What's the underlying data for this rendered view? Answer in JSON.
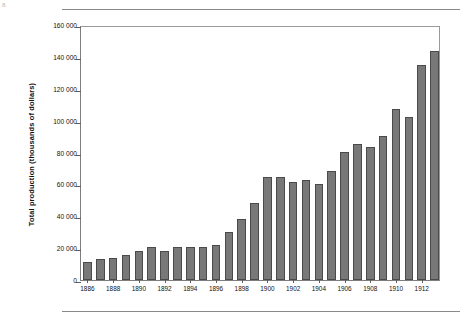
{
  "page": {
    "corner_mark": "8",
    "top_rule": true,
    "bottom_rule": true
  },
  "chart_data": {
    "type": "bar",
    "title": "",
    "xlabel": "",
    "ylabel": "Total production (thousands of dollars)",
    "ylim": [
      0,
      160000
    ],
    "ytick_labels": [
      "0",
      "20 000",
      "40 000",
      "60 000",
      "80 000",
      "100 000",
      "120 000",
      "140 000",
      "160 000"
    ],
    "ytick_values": [
      0,
      20000,
      40000,
      60000,
      80000,
      100000,
      120000,
      140000,
      160000
    ],
    "grid": false,
    "legend": null,
    "bar_color": "#787878",
    "bar_edge_color": "#4a4a4a",
    "categories": [
      1886,
      1887,
      1888,
      1889,
      1890,
      1891,
      1892,
      1893,
      1894,
      1895,
      1896,
      1897,
      1898,
      1899,
      1900,
      1901,
      1902,
      1903,
      1904,
      1905,
      1906,
      1907,
      1908,
      1909,
      1910,
      1911,
      1912,
      1913
    ],
    "xtick_labels": [
      "1886",
      "1888",
      "1890",
      "1892",
      "1894",
      "1896",
      "1898",
      "1900",
      "1902",
      "1904",
      "1906",
      "1908",
      "1910",
      "1912"
    ],
    "xtick_values": [
      1886,
      1888,
      1890,
      1892,
      1894,
      1896,
      1898,
      1900,
      1902,
      1904,
      1906,
      1908,
      1910,
      1912
    ],
    "values": [
      11500,
      13000,
      13500,
      15500,
      18000,
      20500,
      18500,
      20500,
      20500,
      20500,
      22000,
      30000,
      38500,
      48500,
      64500,
      64500,
      61500,
      62500,
      60500,
      68500,
      80500,
      85500,
      83500,
      90500,
      107000,
      102500,
      135000,
      143500
    ]
  }
}
